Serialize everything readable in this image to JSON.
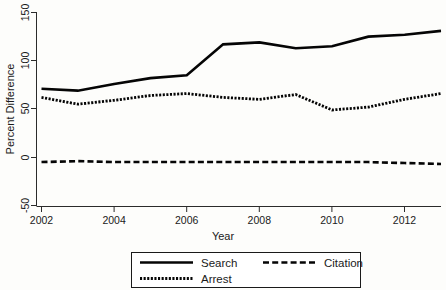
{
  "chart_data": {
    "type": "line",
    "title": "",
    "xlabel": "Year",
    "ylabel": "Percent Difference",
    "xlim": [
      2002,
      2013
    ],
    "ylim": [
      -50,
      150
    ],
    "xticks": [
      2002,
      2004,
      2006,
      2008,
      2010,
      2012
    ],
    "xticklabels": [
      "2002",
      "2004",
      "2006",
      "2008",
      "2010",
      "2012"
    ],
    "yticks": [
      -50,
      0,
      50,
      100,
      150
    ],
    "yticklabels": [
      "-50",
      "0",
      "50",
      "100",
      "150"
    ],
    "grid": false,
    "legend_position": "below-center",
    "x": [
      2002,
      2003,
      2004,
      2005,
      2006,
      2007,
      2008,
      2009,
      2010,
      2011,
      2012,
      2013
    ],
    "series": [
      {
        "name": "Search",
        "style": "solid",
        "color": "#050505",
        "values": [
          71,
          69,
          76,
          82,
          85,
          117,
          119,
          113,
          115,
          125,
          127,
          131
        ]
      },
      {
        "name": "Citation",
        "style": "dashed",
        "color": "#050505",
        "values": [
          -5,
          -4,
          -5,
          -5,
          -5,
          -5,
          -5,
          -5,
          -5,
          -5,
          -6,
          -7
        ]
      },
      {
        "name": "Arrest",
        "style": "dotted",
        "color": "#050505",
        "values": [
          62,
          55,
          59,
          64,
          66,
          62,
          60,
          65,
          49,
          52,
          60,
          66
        ]
      }
    ]
  },
  "legend": {
    "entries": [
      {
        "label": "Search",
        "style": "solid"
      },
      {
        "label": "Citation",
        "style": "dashed"
      },
      {
        "label": "Arrest",
        "style": "dotted"
      }
    ]
  },
  "axes": {
    "y_title": "Percent Difference",
    "x_title": "Year"
  }
}
